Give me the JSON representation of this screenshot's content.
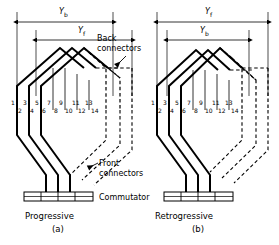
{
  "figure": {
    "conductor_numbers": [
      "1",
      "2",
      "3",
      "4",
      "5",
      "6",
      "7",
      "8",
      "9",
      "10",
      "11",
      "12",
      "13",
      "14"
    ],
    "annotations": {
      "back_connectors": "Back connectors",
      "front_connectors": "Front connectors",
      "commutator": "Commutator"
    },
    "dimensions": {
      "y_b_symbol": "Y",
      "y_b_subscript": "b",
      "y_f_symbol": "Y",
      "y_f_subscript": "f"
    },
    "panels": [
      {
        "id": "a",
        "name": "Progressive",
        "caption": "Progressive",
        "sub_caption": "(a)",
        "outer_dimension": "Y_b",
        "inner_dimension": "Y_f",
        "outer_dimension_label": "b",
        "inner_dimension_label": "f",
        "front_connector_direction": "down-left"
      },
      {
        "id": "b",
        "name": "Retrogressive",
        "caption": "Retrogressive",
        "sub_caption": "(b)",
        "outer_dimension": "Y_f",
        "inner_dimension": "Y_b",
        "outer_dimension_label": "f",
        "inner_dimension_label": "b",
        "front_connector_direction": "down-right"
      }
    ],
    "colors": {
      "line": "#000000",
      "background": "#ffffff"
    }
  }
}
